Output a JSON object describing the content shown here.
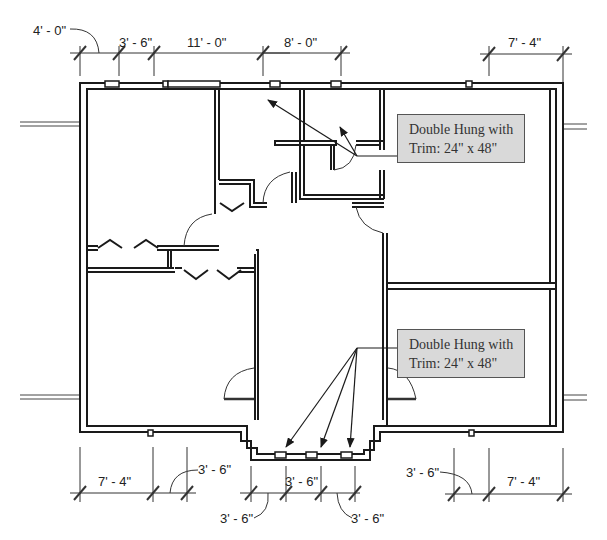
{
  "drawing": {
    "type": "floor-plan",
    "colors": {
      "wall": "#1a1a1a",
      "callout_fill": "#d9d9d9",
      "callout_border": "#555555",
      "dimension": "#222222"
    }
  },
  "dimensions": {
    "top": [
      {
        "label": "4' - 0\"",
        "position": "top-left-leader"
      },
      {
        "label": "3' - 6\"",
        "position": "top"
      },
      {
        "label": "11' - 0\"",
        "position": "top"
      },
      {
        "label": "8' - 0\"",
        "position": "top"
      },
      {
        "label": "7' - 4\"",
        "position": "top-right"
      }
    ],
    "bottom": [
      {
        "label": "7' - 4\"",
        "position": "bottom-left"
      },
      {
        "label": "3' - 6\"",
        "position": "bottom-left-leader"
      },
      {
        "label": "3' - 6\"",
        "position": "bottom-center"
      },
      {
        "label": "3' - 6\"",
        "position": "bottom-center-left-leader"
      },
      {
        "label": "3' - 6\"",
        "position": "bottom-center-right-leader"
      },
      {
        "label": "3' - 6\"",
        "position": "bottom-right-leader"
      },
      {
        "label": "7' - 4\"",
        "position": "bottom-right"
      }
    ]
  },
  "callouts": [
    {
      "line1": "Double Hung with",
      "line2": "Trim: 24\" x 48\"",
      "target": "upper windows"
    },
    {
      "line1": "Double Hung with",
      "line2": "Trim: 24\" x 48\"",
      "target": "entry windows"
    }
  ]
}
